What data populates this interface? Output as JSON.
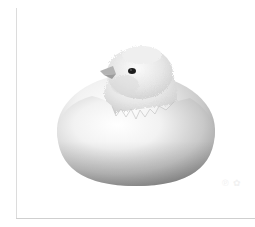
{
  "image": {
    "subject": "Chick hatching from a cracked white egg",
    "alt": "A fluffy chick emerging from the top of a cracked egg",
    "background_color": "#ffffff",
    "egg_color_light": "#f7f7f7",
    "egg_color_shadow": "#9a9a9a",
    "chick_color": "#e9e9e9",
    "eye_color": "#1e1e1e",
    "beak_color": "#a8a8a8",
    "frame_color": "#d6d6d6"
  },
  "watermark": {
    "text": "℗ ✿"
  }
}
